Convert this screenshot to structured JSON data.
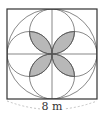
{
  "diagram": {
    "title": "",
    "shape": "square-with-inscribed-circle-and-four-semicircles",
    "dimension_label": "8 m",
    "colors": {
      "stroke": "#555555",
      "shaded_fill": "#b8b8b8",
      "background": "#ffffff",
      "dimension_line": "#aaaaaa"
    },
    "elements": [
      {
        "type": "square",
        "side": "8 m"
      },
      {
        "type": "circle",
        "note": "inscribed circle"
      },
      {
        "type": "semicircles",
        "count": 4,
        "note": "on each side, through center"
      },
      {
        "type": "lines",
        "note": "horizontal and vertical midlines"
      },
      {
        "type": "shaded_petals",
        "count": 4,
        "note": "four-leaf shaded region at center"
      }
    ]
  }
}
